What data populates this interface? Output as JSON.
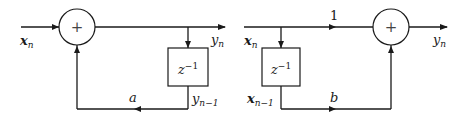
{
  "diagrams": [
    {
      "name": "iir-first-order",
      "adder_symbol": "+",
      "input_label": {
        "base": "x",
        "sub": "n"
      },
      "output_label": {
        "base": "y",
        "sub": "n"
      },
      "delay_label": {
        "base": "z",
        "sup": "−1"
      },
      "delay_output_label": {
        "base": "y",
        "sub": "n−1"
      },
      "gain_label": "a"
    },
    {
      "name": "fir-first-order",
      "adder_symbol": "+",
      "input_label": {
        "base": "x",
        "sub": "n"
      },
      "output_label": {
        "base": "y",
        "sub": "n"
      },
      "delay_label": {
        "base": "z",
        "sup": "−1"
      },
      "delay_output_label": {
        "base": "x",
        "sub": "n−1"
      },
      "direct_gain_label": "1",
      "gain_label": "b"
    }
  ]
}
